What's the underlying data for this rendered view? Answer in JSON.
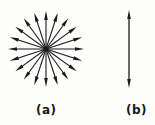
{
  "figure": {
    "background_color": "#fdfdfc",
    "ink_color": "#1a1a1a",
    "width": 155,
    "height": 125,
    "panels": [
      {
        "id": "a",
        "label": "(a)",
        "label_x": 36,
        "label_y": 104,
        "type": "radial-arrow-star",
        "description": "isotropic radial emission",
        "center_x": 46,
        "center_y": 49,
        "radius": 38,
        "arrow_count": 20,
        "angle_step_degrees": 18,
        "start_angle_degrees": 0,
        "arrowhead_length": 9,
        "arrowhead_width": 3.6,
        "shaft_width": 1.1
      },
      {
        "id": "b",
        "label": "(b)",
        "label_x": 126,
        "label_y": 104,
        "type": "double-headed-arrow",
        "description": "single linear polarized direction",
        "x": 129,
        "y_top": 10,
        "y_bottom": 88,
        "arrowhead_length": 9,
        "arrowhead_width": 3.6,
        "shaft_width": 1.3
      }
    ]
  }
}
